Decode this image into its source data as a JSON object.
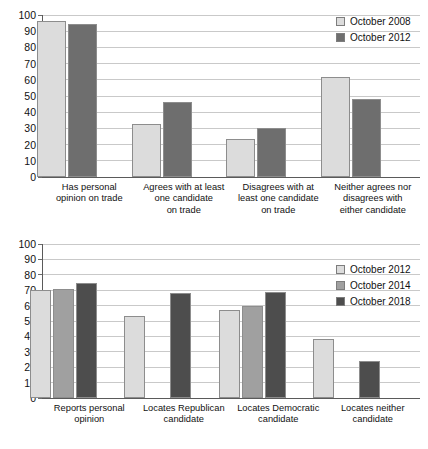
{
  "chart_data": [
    {
      "type": "bar",
      "id": "trade-opinion-chart",
      "title": "",
      "xlabel": "",
      "ylabel": "",
      "ylim": [
        0,
        100
      ],
      "yticks": [
        0,
        10,
        20,
        30,
        40,
        50,
        60,
        70,
        80,
        90,
        100
      ],
      "grid": true,
      "legend_position": "top-right",
      "categories": [
        "Has personal opinion on trade",
        "Agrees with at least one candidate on trade",
        "Disagrees with at least one candidate on trade",
        "Neither agrees nor disagrees with either candidate"
      ],
      "category_lines": [
        [
          "Has personal",
          "opinion on trade"
        ],
        [
          "Agrees with at least",
          "one candidate",
          "on trade"
        ],
        [
          "Disagrees with at",
          "least one candidate",
          "on trade"
        ],
        [
          "Neither agrees nor",
          "disagrees with",
          "either candidate"
        ]
      ],
      "series": [
        {
          "name": "October 2008",
          "swatch": "#dcdcdc",
          "values": [
            96,
            32.5,
            23.5,
            62
          ]
        },
        {
          "name": "October 2012",
          "swatch": "#6e6e6e",
          "values": [
            94.5,
            46.5,
            30.5,
            48
          ]
        }
      ]
    },
    {
      "type": "bar",
      "id": "candidate-location-chart",
      "title": "",
      "xlabel": "",
      "ylabel": "",
      "ylim": [
        0,
        100
      ],
      "yticks": [
        0,
        10,
        20,
        30,
        40,
        50,
        60,
        70,
        80,
        90,
        100
      ],
      "grid": true,
      "legend_position": "right",
      "categories": [
        "Reports personal opinion",
        "Locates Republican candidate",
        "Locates Democratic candidate",
        "Locates neither candidate"
      ],
      "category_lines": [
        [
          "Reports personal",
          "opinion"
        ],
        [
          "Locates Republican",
          "candidate"
        ],
        [
          "Locates Democratic",
          "candidate"
        ],
        [
          "Locates neither",
          "candidate"
        ]
      ],
      "series": [
        {
          "name": "October 2012",
          "swatch": "#dcdcdc",
          "values": [
            70,
            53,
            57,
            38.5
          ]
        },
        {
          "name": "October 2014",
          "swatch": "#a0a0a0",
          "values": [
            71,
            null,
            59.5,
            null
          ]
        },
        {
          "name": "October 2018",
          "swatch": "#4d4d4d",
          "values": [
            75,
            68,
            69,
            24
          ]
        }
      ]
    }
  ],
  "colors": {
    "series_light": "#dcdcdc",
    "series_mid": "#a0a0a0",
    "series_dark": "#6e6e6e",
    "series_darkest": "#4d4d4d",
    "gridline": "#c9c9c9",
    "axis": "#5a5a5a",
    "text": "#111111",
    "background": "#ffffff"
  }
}
